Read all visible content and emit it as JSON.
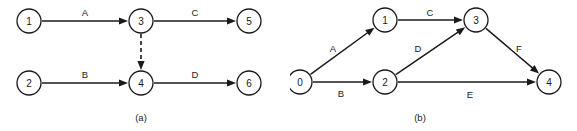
{
  "figure": {
    "panels": [
      {
        "caption": "(a)",
        "caption_x": 141,
        "caption_y": 117,
        "nodes": [
          {
            "id": "1",
            "label": "1",
            "cx": 29,
            "cy": 21,
            "r": 12
          },
          {
            "id": "3",
            "label": "3",
            "cx": 141,
            "cy": 21,
            "r": 12
          },
          {
            "id": "5",
            "label": "5",
            "cx": 249,
            "cy": 21,
            "r": 12
          },
          {
            "id": "2",
            "label": "2",
            "cx": 29,
            "cy": 83,
            "r": 12
          },
          {
            "id": "4",
            "label": "4",
            "cx": 141,
            "cy": 83,
            "r": 12
          },
          {
            "id": "6",
            "label": "6",
            "cx": 249,
            "cy": 83,
            "r": 12
          }
        ],
        "edges": [
          {
            "from": "1",
            "to": "3",
            "label": "A",
            "label_x": 85,
            "label_y": 12,
            "style": "solid"
          },
          {
            "from": "3",
            "to": "5",
            "label": "C",
            "label_x": 195,
            "label_y": 12,
            "style": "solid"
          },
          {
            "from": "2",
            "to": "4",
            "label": "B",
            "label_x": 85,
            "label_y": 74,
            "style": "solid"
          },
          {
            "from": "4",
            "to": "6",
            "label": "D",
            "label_x": 195,
            "label_y": 74,
            "style": "solid"
          },
          {
            "from": "3",
            "to": "4",
            "label": "",
            "label_x": 0,
            "label_y": 0,
            "style": "dashed"
          }
        ]
      },
      {
        "caption": "(b)",
        "caption_x": 420,
        "caption_y": 117,
        "nodes": [
          {
            "id": "0",
            "label": "0",
            "cx": 300,
            "cy": 82,
            "r": 12
          },
          {
            "id": "1",
            "label": "1",
            "cx": 385,
            "cy": 20,
            "r": 12
          },
          {
            "id": "2",
            "label": "2",
            "cx": 385,
            "cy": 82,
            "r": 12
          },
          {
            "id": "3",
            "label": "3",
            "cx": 476,
            "cy": 20,
            "r": 12
          },
          {
            "id": "4",
            "label": "4",
            "cx": 549,
            "cy": 82,
            "r": 12
          }
        ],
        "edges": [
          {
            "from": "0",
            "to": "1",
            "label": "A",
            "label_x": 333,
            "label_y": 48,
            "style": "solid"
          },
          {
            "from": "0",
            "to": "2",
            "label": "B",
            "label_x": 341,
            "label_y": 93,
            "style": "solid"
          },
          {
            "from": "1",
            "to": "3",
            "label": "C",
            "label_x": 430,
            "label_y": 12,
            "style": "solid"
          },
          {
            "from": "2",
            "to": "3",
            "label": "D",
            "label_x": 418,
            "label_y": 48,
            "style": "solid"
          },
          {
            "from": "2",
            "to": "4",
            "label": "E",
            "label_x": 470,
            "label_y": 94,
            "style": "solid"
          },
          {
            "from": "3",
            "to": "4",
            "label": "F",
            "label_x": 519,
            "label_y": 48,
            "style": "solid"
          }
        ]
      }
    ],
    "colors": {
      "ink": "#1a1a1a",
      "background": "#ffffff",
      "node_fill": "#ffffff"
    }
  }
}
